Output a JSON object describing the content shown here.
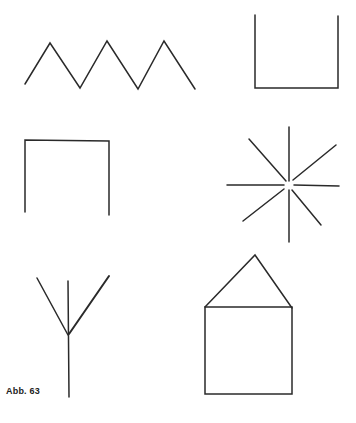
{
  "figure": {
    "caption": "Abb. 63",
    "stroke_color": "#2a2a2a",
    "background": "#ffffff",
    "shapes": [
      {
        "name": "zigzag",
        "points": "25,84 50,43 80,88 107,41 138,89 164,41 195,89"
      },
      {
        "name": "u-shape-open-top",
        "points": "255,15 255,88 338,88 338,16"
      },
      {
        "name": "u-shape-open-bottom",
        "points": "25,212 25,140 109,141 109,215"
      },
      {
        "name": "star-burst",
        "center": [
          289,
          185
        ]
      },
      {
        "name": "tree-fork"
      },
      {
        "name": "house"
      }
    ]
  }
}
